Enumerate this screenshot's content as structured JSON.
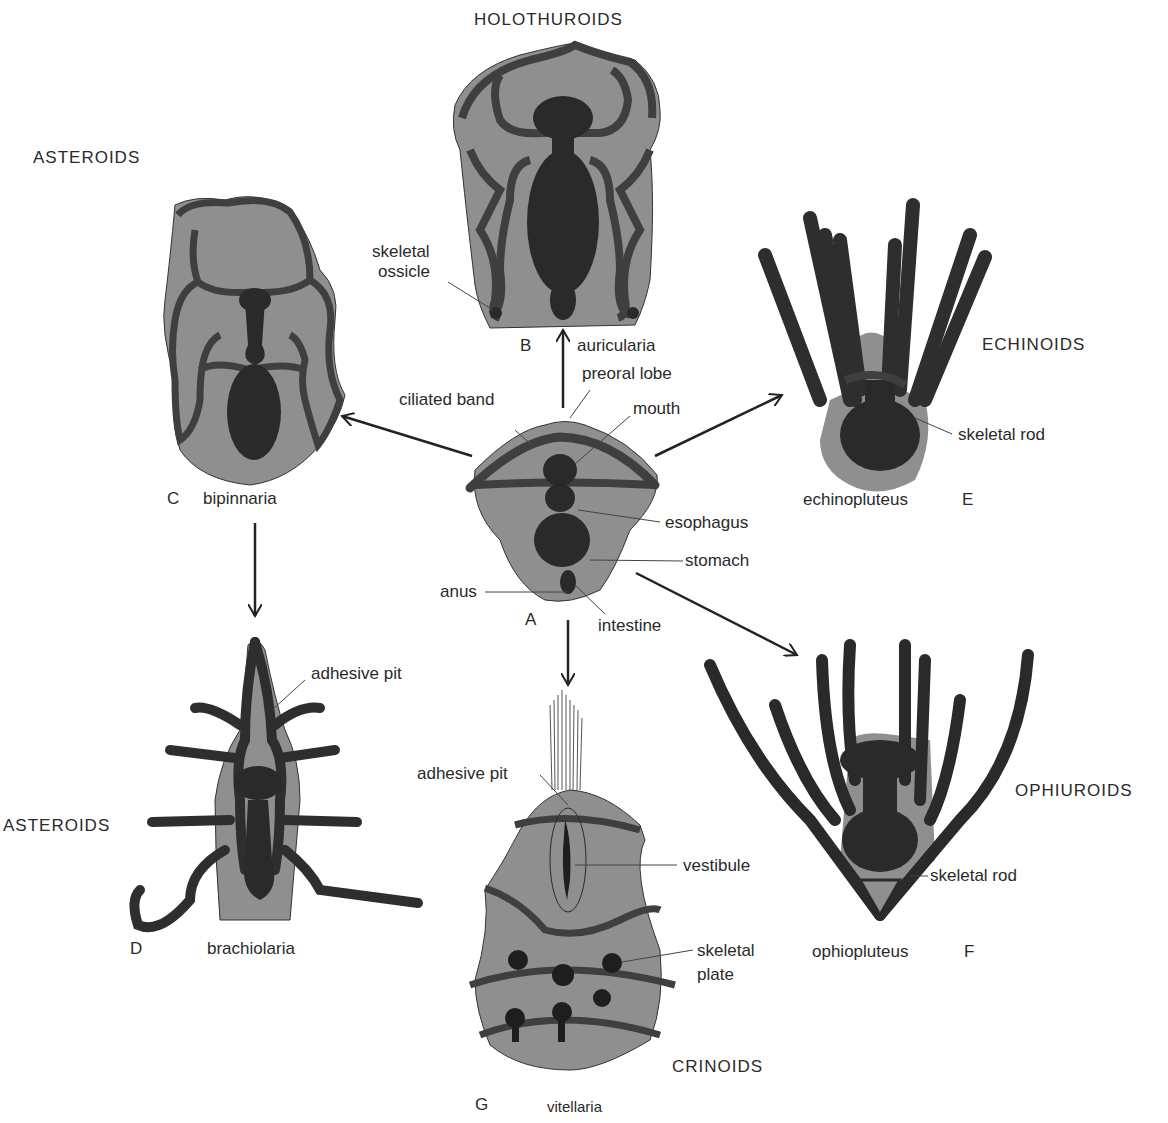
{
  "colors": {
    "background": "#ffffff",
    "body_fill": "#8f8f8f",
    "gut": "#2a2a2a",
    "ciliated_band": "#4a4a4a",
    "text": "#2a2a2a"
  },
  "groups": {
    "holothuroids": "HOLOTHUROIDS",
    "asteroids_top": "ASTEROIDS",
    "echinoids": "ECHINOIDS",
    "asteroids_bottom": "ASTEROIDS",
    "ophiuroids": "OPHIUROIDS",
    "crinoids": "CRINOIDS"
  },
  "larvae": {
    "A": {
      "letter": "A"
    },
    "B": {
      "letter": "B",
      "name": "auricularia"
    },
    "C": {
      "letter": "C",
      "name": "bipinnaria"
    },
    "D": {
      "letter": "D",
      "name": "brachiolaria"
    },
    "E": {
      "letter": "E",
      "name": "echinopluteus"
    },
    "F": {
      "letter": "F",
      "name": "ophiopluteus"
    },
    "G": {
      "letter": "G",
      "name": "vitellaria"
    }
  },
  "labels": {
    "skeletal_ossicle_1": "skeletal",
    "skeletal_ossicle_2": "ossicle",
    "preoral_lobe": "preoral lobe",
    "ciliated_band": "ciliated band",
    "mouth": "mouth",
    "esophagus": "esophagus",
    "stomach": "stomach",
    "anus": "anus",
    "intestine": "intestine",
    "skeletal_rod_E": "skeletal rod",
    "adhesive_pit_D": "adhesive pit",
    "adhesive_pit_G": "adhesive pit",
    "vestibule": "vestibule",
    "skeletal_plate_1": "skeletal",
    "skeletal_plate_2": "plate",
    "skeletal_rod_F": "skeletal rod"
  }
}
